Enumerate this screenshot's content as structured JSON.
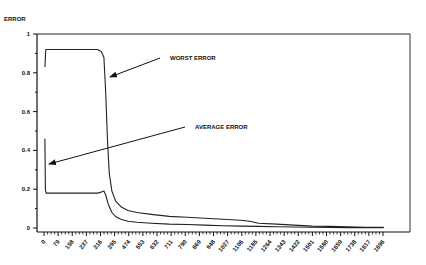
{
  "chart_data": {
    "type": "line",
    "title": "",
    "ylabel": "ERROR",
    "xlabel": "",
    "ylim": [
      0,
      1
    ],
    "xlim": [
      0,
      1975
    ],
    "grid": false,
    "legend": "annotations with arrows",
    "y_ticks": [
      "0",
      "0.2",
      "0.4",
      "0.6",
      "0.8",
      "1"
    ],
    "x_ticks": [
      "0",
      "79",
      "158",
      "237",
      "316",
      "395",
      "474",
      "553",
      "632",
      "711",
      "790",
      "869",
      "948",
      "1027",
      "1106",
      "1185",
      "1264",
      "1343",
      "1422",
      "1501",
      "1580",
      "1659",
      "1738",
      "1817",
      "1896"
    ],
    "annotations": [
      {
        "text": "WORST ERROR",
        "arrow_to": [
          340,
          0.78
        ]
      },
      {
        "text": "AVERAGE ERROR",
        "arrow_to": [
          10,
          0.32
        ]
      }
    ],
    "series": [
      {
        "name": "WORST ERROR",
        "x": [
          5,
          10,
          40,
          100,
          200,
          300,
          320,
          335,
          345,
          355,
          365,
          380,
          400,
          430,
          470,
          520,
          600,
          700,
          800,
          900,
          1000,
          1100,
          1150,
          1200,
          1300,
          1400,
          1500,
          1600,
          1700,
          1800,
          1900
        ],
        "values": [
          0.83,
          0.92,
          0.92,
          0.92,
          0.92,
          0.92,
          0.91,
          0.88,
          0.7,
          0.45,
          0.28,
          0.19,
          0.14,
          0.11,
          0.09,
          0.08,
          0.07,
          0.06,
          0.055,
          0.05,
          0.045,
          0.04,
          0.035,
          0.025,
          0.02,
          0.015,
          0.01,
          0.008,
          0.006,
          0.004,
          0.003
        ]
      },
      {
        "name": "AVERAGE ERROR",
        "x": [
          5,
          8,
          12,
          40,
          100,
          200,
          300,
          320,
          335,
          345,
          360,
          380,
          400,
          430,
          470,
          520,
          600,
          700,
          800,
          900,
          1000,
          1100,
          1200,
          1300,
          1400,
          1500,
          1600,
          1700,
          1800,
          1900
        ],
        "values": [
          0.46,
          0.2,
          0.18,
          0.18,
          0.18,
          0.18,
          0.18,
          0.185,
          0.19,
          0.17,
          0.12,
          0.08,
          0.06,
          0.045,
          0.035,
          0.03,
          0.025,
          0.02,
          0.018,
          0.015,
          0.012,
          0.01,
          0.008,
          0.006,
          0.005,
          0.004,
          0.003,
          0.002,
          0.002,
          0.001
        ]
      }
    ]
  },
  "labels": {
    "y_axis_title": "ERROR",
    "worst": "WORST ERROR",
    "average": "AVERAGE ERROR"
  }
}
